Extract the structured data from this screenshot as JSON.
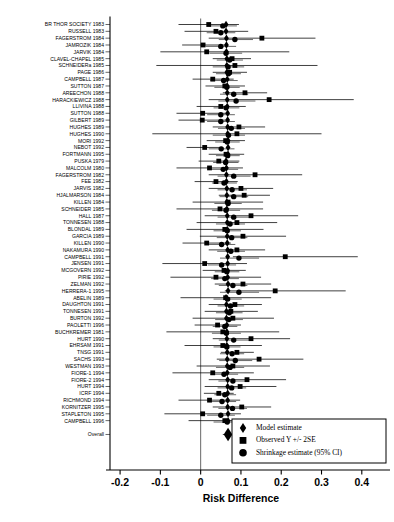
{
  "chart_data": {
    "type": "forest",
    "title": "",
    "xlabel": "Risk Difference",
    "ylabel": "",
    "xlim": [
      -0.23,
      0.47
    ],
    "xticks": [
      -0.2,
      -0.1,
      0,
      0.1,
      0.2,
      0.3,
      0.4
    ],
    "xticklabels": [
      "-0.2",
      "-0.1",
      "0",
      "0.1",
      "0.2",
      "0.3",
      "0.4"
    ],
    "grid": false,
    "zero_reference_line": 0,
    "legend_position": "bottom-right",
    "legend": [
      {
        "marker": "diamond",
        "label": "Model estimate"
      },
      {
        "marker": "square",
        "label": "Observed Y +/- 2SE"
      },
      {
        "marker": "circle",
        "label": "Shrinkage estimate (95% CI)"
      }
    ],
    "overall_label": "Overall",
    "overall": {
      "model": 0.068,
      "lo": 0.055,
      "hi": 0.082
    },
    "studies": [
      {
        "label": "BR THOR SOCIETY 1983",
        "model": 0.063,
        "obs": 0.02,
        "obs_lo": -0.055,
        "obs_hi": 0.095,
        "shr": 0.055,
        "shr_lo": 0.02,
        "shr_hi": 0.09
      },
      {
        "label": "RUSSELL 1983",
        "model": 0.063,
        "obs": 0.038,
        "obs_lo": -0.04,
        "obs_hi": 0.118,
        "shr": 0.05,
        "shr_lo": 0.015,
        "shr_hi": 0.086
      },
      {
        "label": "FAGERSTROM 1984",
        "model": 0.064,
        "obs": 0.152,
        "obs_lo": 0.02,
        "obs_hi": 0.285,
        "shr": 0.085,
        "shr_lo": 0.045,
        "shr_hi": 0.13
      },
      {
        "label": "JAMROZIK 1984",
        "model": 0.064,
        "obs": 0.006,
        "obs_lo": -0.046,
        "obs_hi": 0.06,
        "shr": 0.05,
        "shr_lo": 0.012,
        "shr_hi": 0.088
      },
      {
        "label": "JARVIK 1984",
        "model": 0.064,
        "obs": 0.015,
        "obs_lo": -0.1,
        "obs_hi": 0.22,
        "shr": 0.063,
        "shr_lo": 0.022,
        "shr_hi": 0.103
      },
      {
        "label": "CLAVEL-CHAPEL 1985",
        "model": 0.065,
        "obs": 0.078,
        "obs_lo": 0.03,
        "obs_hi": 0.125,
        "shr": 0.072,
        "shr_lo": 0.04,
        "shr_hi": 0.105
      },
      {
        "label": "SCHNEIDERa 1985",
        "model": 0.065,
        "obs": 0.085,
        "obs_lo": -0.11,
        "obs_hi": 0.29,
        "shr": 0.068,
        "shr_lo": 0.03,
        "shr_hi": 0.108
      },
      {
        "label": "PAGE 1986",
        "model": 0.065,
        "obs": 0.072,
        "obs_lo": 0.03,
        "obs_hi": 0.115,
        "shr": 0.069,
        "shr_lo": 0.038,
        "shr_hi": 0.1
      },
      {
        "label": "CAMPBELL 1987",
        "model": 0.066,
        "obs": 0.03,
        "obs_lo": -0.02,
        "obs_hi": 0.082,
        "shr": 0.057,
        "shr_lo": 0.024,
        "shr_hi": 0.092
      },
      {
        "label": "SUTTON 1987",
        "model": 0.066,
        "obs": 0.06,
        "obs_lo": 0.012,
        "obs_hi": 0.11,
        "shr": 0.065,
        "shr_lo": 0.034,
        "shr_hi": 0.097
      },
      {
        "label": "AREECHON 1988",
        "model": 0.066,
        "obs": 0.11,
        "obs_lo": 0.055,
        "obs_hi": 0.165,
        "shr": 0.082,
        "shr_lo": 0.048,
        "shr_hi": 0.118
      },
      {
        "label": "HARACKIEWICZ 1988",
        "model": 0.066,
        "obs": 0.17,
        "obs_lo": 0.02,
        "obs_hi": 0.38,
        "shr": 0.088,
        "shr_lo": 0.044,
        "shr_hi": 0.136
      },
      {
        "label": "LLIVINA 1988",
        "model": 0.066,
        "obs": 0.05,
        "obs_lo": -0.01,
        "obs_hi": 0.112,
        "shr": 0.063,
        "shr_lo": 0.032,
        "shr_hi": 0.096
      },
      {
        "label": "SUTTON 1988",
        "model": 0.067,
        "obs": 0.005,
        "obs_lo": -0.06,
        "obs_hi": 0.07,
        "shr": 0.05,
        "shr_lo": 0.016,
        "shr_hi": 0.085
      },
      {
        "label": "GILBERT 1989",
        "model": 0.067,
        "obs": 0.004,
        "obs_lo": -0.055,
        "obs_hi": 0.064,
        "shr": 0.05,
        "shr_lo": 0.016,
        "shr_hi": 0.085
      },
      {
        "label": "HUGHES 1989",
        "model": 0.067,
        "obs": 0.095,
        "obs_lo": 0.03,
        "obs_hi": 0.16,
        "shr": 0.076,
        "shr_lo": 0.043,
        "shr_hi": 0.11
      },
      {
        "label": "HUGHES 1990",
        "model": 0.067,
        "obs": 0.09,
        "obs_lo": -0.12,
        "obs_hi": 0.3,
        "shr": 0.069,
        "shr_lo": 0.03,
        "shr_hi": 0.11
      },
      {
        "label": "MORI 1992",
        "model": 0.068,
        "obs": 0.062,
        "obs_lo": 0.015,
        "obs_hi": 0.11,
        "shr": 0.066,
        "shr_lo": 0.036,
        "shr_hi": 0.097
      },
      {
        "label": "NEBOT 1992",
        "model": 0.068,
        "obs": 0.01,
        "obs_lo": -0.035,
        "obs_hi": 0.056,
        "shr": 0.051,
        "shr_lo": 0.02,
        "shr_hi": 0.084
      },
      {
        "label": "FORTMANN 1995",
        "model": 0.068,
        "obs": 0.063,
        "obs_lo": 0.02,
        "obs_hi": 0.108,
        "shr": 0.067,
        "shr_lo": 0.038,
        "shr_hi": 0.097
      },
      {
        "label": "PUSKA 1979",
        "model": 0.063,
        "obs": 0.045,
        "obs_lo": -0.005,
        "obs_hi": 0.096,
        "shr": 0.062,
        "shr_lo": 0.031,
        "shr_hi": 0.094
      },
      {
        "label": "MALCOLM 1980",
        "model": 0.064,
        "obs": 0.022,
        "obs_lo": -0.06,
        "obs_hi": 0.105,
        "shr": 0.056,
        "shr_lo": 0.02,
        "shr_hi": 0.093
      },
      {
        "label": "FAGERSTROM 1982",
        "model": 0.064,
        "obs": 0.135,
        "obs_lo": 0.02,
        "obs_hi": 0.252,
        "shr": 0.082,
        "shr_lo": 0.042,
        "shr_hi": 0.124
      },
      {
        "label": "FEE 1982",
        "model": 0.064,
        "obs": 0.038,
        "obs_lo": -0.015,
        "obs_hi": 0.092,
        "shr": 0.058,
        "shr_lo": 0.028,
        "shr_hi": 0.09
      },
      {
        "label": "JARVIS 1982",
        "model": 0.065,
        "obs": 0.1,
        "obs_lo": 0.02,
        "obs_hi": 0.18,
        "shr": 0.078,
        "shr_lo": 0.042,
        "shr_hi": 0.115
      },
      {
        "label": "HJALMARSON 1984",
        "model": 0.065,
        "obs": 0.108,
        "obs_lo": 0.045,
        "obs_hi": 0.172,
        "shr": 0.082,
        "shr_lo": 0.047,
        "shr_hi": 0.118
      },
      {
        "label": "KILLEN 1984",
        "model": 0.065,
        "obs": 0.068,
        "obs_lo": -0.02,
        "obs_hi": 0.155,
        "shr": 0.068,
        "shr_lo": 0.034,
        "shr_hi": 0.102
      },
      {
        "label": "SCHNEIDER 1985",
        "model": 0.065,
        "obs": 0.048,
        "obs_lo": -0.06,
        "obs_hi": 0.155,
        "shr": 0.063,
        "shr_lo": 0.028,
        "shr_hi": 0.098
      },
      {
        "label": "HALL 1987",
        "model": 0.066,
        "obs": 0.125,
        "obs_lo": 0.01,
        "obs_hi": 0.242,
        "shr": 0.082,
        "shr_lo": 0.042,
        "shr_hi": 0.124
      },
      {
        "label": "TONNESEN 1988",
        "model": 0.066,
        "obs": 0.09,
        "obs_lo": -0.01,
        "obs_hi": 0.19,
        "shr": 0.073,
        "shr_lo": 0.038,
        "shr_hi": 0.11
      },
      {
        "label": "BLONDAL 1989",
        "model": 0.066,
        "obs": 0.06,
        "obs_lo": -0.035,
        "obs_hi": 0.156,
        "shr": 0.066,
        "shr_lo": 0.032,
        "shr_hi": 0.1
      },
      {
        "label": "GARCIA 1989",
        "model": 0.066,
        "obs": 0.105,
        "obs_lo": -0.002,
        "obs_hi": 0.212,
        "shr": 0.077,
        "shr_lo": 0.04,
        "shr_hi": 0.116
      },
      {
        "label": "KILLEN 1990",
        "model": 0.066,
        "obs": 0.015,
        "obs_lo": -0.045,
        "obs_hi": 0.075,
        "shr": 0.052,
        "shr_lo": 0.02,
        "shr_hi": 0.086
      },
      {
        "label": "NAKAMURA 1990",
        "model": 0.067,
        "obs": 0.09,
        "obs_lo": 0.02,
        "obs_hi": 0.16,
        "shr": 0.075,
        "shr_lo": 0.041,
        "shr_hi": 0.11
      },
      {
        "label": "CAMPBELL 1991",
        "model": 0.067,
        "obs": 0.21,
        "obs_lo": 0.08,
        "obs_hi": 0.39,
        "shr": 0.095,
        "shr_lo": 0.048,
        "shr_hi": 0.145
      },
      {
        "label": "JENSEN 1991",
        "model": 0.067,
        "obs": 0.01,
        "obs_lo": -0.095,
        "obs_hi": 0.115,
        "shr": 0.052,
        "shr_lo": 0.018,
        "shr_hi": 0.088
      },
      {
        "label": "MCGOVERN 1992",
        "model": 0.067,
        "obs": 0.058,
        "obs_lo": 0.005,
        "obs_hi": 0.112,
        "shr": 0.065,
        "shr_lo": 0.035,
        "shr_hi": 0.096
      },
      {
        "label": "PIRIE 1992",
        "model": 0.067,
        "obs": 0.038,
        "obs_lo": -0.075,
        "obs_hi": 0.15,
        "shr": 0.06,
        "shr_lo": 0.026,
        "shr_hi": 0.095
      },
      {
        "label": "ZELMAN 1992",
        "model": 0.068,
        "obs": 0.105,
        "obs_lo": 0.035,
        "obs_hi": 0.175,
        "shr": 0.08,
        "shr_lo": 0.045,
        "shr_hi": 0.116
      },
      {
        "label": "HERRERA-1 1995",
        "model": 0.068,
        "obs": 0.185,
        "obs_lo": 0.06,
        "obs_hi": 0.36,
        "shr": 0.095,
        "shr_lo": 0.048,
        "shr_hi": 0.145
      },
      {
        "label": "ABELIN 1989",
        "model": 0.063,
        "obs": 0.062,
        "obs_lo": -0.05,
        "obs_hi": 0.175,
        "shr": 0.067,
        "shr_lo": 0.032,
        "shr_hi": 0.102
      },
      {
        "label": "DAUGHTON 1991",
        "model": 0.064,
        "obs": 0.085,
        "obs_lo": 0.02,
        "obs_hi": 0.152,
        "shr": 0.074,
        "shr_lo": 0.042,
        "shr_hi": 0.108
      },
      {
        "label": "TONNESEN 1991",
        "model": 0.064,
        "obs": 0.075,
        "obs_lo": 0.01,
        "obs_hi": 0.142,
        "shr": 0.071,
        "shr_lo": 0.038,
        "shr_hi": 0.104
      },
      {
        "label": "BURTON 1992",
        "model": 0.064,
        "obs": 0.08,
        "obs_lo": -0.02,
        "obs_hi": 0.182,
        "shr": 0.07,
        "shr_lo": 0.036,
        "shr_hi": 0.105
      },
      {
        "label": "PAOLETTI 1996",
        "model": 0.065,
        "obs": 0.042,
        "obs_lo": -0.015,
        "obs_hi": 0.1,
        "shr": 0.06,
        "shr_lo": 0.03,
        "shr_hi": 0.091
      },
      {
        "label": "BUCHKREMER 1981",
        "model": 0.065,
        "obs": 0.055,
        "obs_lo": -0.085,
        "obs_hi": 0.195,
        "shr": 0.064,
        "shr_lo": 0.028,
        "shr_hi": 0.1
      },
      {
        "label": "HURT 1990",
        "model": 0.065,
        "obs": 0.125,
        "obs_lo": 0.03,
        "obs_hi": 0.222,
        "shr": 0.082,
        "shr_lo": 0.045,
        "shr_hi": 0.122
      },
      {
        "label": "EHRSAM 1991",
        "model": 0.065,
        "obs": 0.055,
        "obs_lo": -0.04,
        "obs_hi": 0.152,
        "shr": 0.065,
        "shr_lo": 0.032,
        "shr_hi": 0.099
      },
      {
        "label": "TNSG 1991",
        "model": 0.066,
        "obs": 0.09,
        "obs_lo": 0.05,
        "obs_hi": 0.132,
        "shr": 0.078,
        "shr_lo": 0.048,
        "shr_hi": 0.108
      },
      {
        "label": "SACHS 1993",
        "model": 0.066,
        "obs": 0.145,
        "obs_lo": 0.04,
        "obs_hi": 0.255,
        "shr": 0.086,
        "shr_lo": 0.046,
        "shr_hi": 0.128
      },
      {
        "label": "WESTMAN 1993",
        "model": 0.066,
        "obs": 0.08,
        "obs_lo": -0.01,
        "obs_hi": 0.172,
        "shr": 0.073,
        "shr_lo": 0.038,
        "shr_hi": 0.108
      },
      {
        "label": "FIORE-1 1994",
        "model": 0.066,
        "obs": 0.03,
        "obs_lo": -0.07,
        "obs_hi": 0.132,
        "shr": 0.058,
        "shr_lo": 0.024,
        "shr_hi": 0.093
      },
      {
        "label": "FIORE-2 1994",
        "model": 0.067,
        "obs": 0.115,
        "obs_lo": 0.02,
        "obs_hi": 0.212,
        "shr": 0.08,
        "shr_lo": 0.044,
        "shr_hi": 0.118
      },
      {
        "label": "HURT 1994",
        "model": 0.067,
        "obs": 0.098,
        "obs_lo": 0.01,
        "obs_hi": 0.188,
        "shr": 0.077,
        "shr_lo": 0.042,
        "shr_hi": 0.113
      },
      {
        "label": "ICRF 1994",
        "model": 0.067,
        "obs": 0.045,
        "obs_lo": 0.008,
        "obs_hi": 0.082,
        "shr": 0.06,
        "shr_lo": 0.034,
        "shr_hi": 0.088
      },
      {
        "label": "RICHMOND 1994",
        "model": 0.067,
        "obs": 0.022,
        "obs_lo": -0.055,
        "obs_hi": 0.098,
        "shr": 0.053,
        "shr_lo": 0.02,
        "shr_hi": 0.088
      },
      {
        "label": "KORNITZER 1995",
        "model": 0.067,
        "obs": 0.102,
        "obs_lo": 0.03,
        "obs_hi": 0.175,
        "shr": 0.079,
        "shr_lo": 0.044,
        "shr_hi": 0.115
      },
      {
        "label": "STAPLETON 1995",
        "model": 0.068,
        "obs": 0.005,
        "obs_lo": -0.09,
        "obs_hi": 0.1,
        "shr": 0.05,
        "shr_lo": 0.016,
        "shr_hi": 0.085
      },
      {
        "label": "CAMPBELL 1996",
        "model": 0.068,
        "obs": 0.06,
        "obs_lo": -0.03,
        "obs_hi": 0.15,
        "shr": 0.066,
        "shr_lo": 0.032,
        "shr_hi": 0.1
      }
    ]
  }
}
